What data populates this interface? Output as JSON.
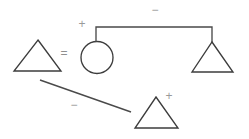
{
  "diagram": {
    "type": "shape-relation-graph",
    "background_color": "#ffffff",
    "stroke_color": "#3c3c3c",
    "label_color": "#9a9a9a",
    "nodes": [
      {
        "id": "triangle-left",
        "shape": "triangle",
        "label": "",
        "apex": [
          38,
          40
        ],
        "base_left": [
          14,
          71
        ],
        "base_right": [
          61,
          71
        ]
      },
      {
        "id": "circle-center",
        "shape": "circle",
        "label": "",
        "center": [
          97,
          57
        ],
        "radius": 16
      },
      {
        "id": "triangle-right",
        "shape": "triangle",
        "label": "",
        "apex": [
          212,
          42
        ],
        "base_left": [
          192,
          72
        ],
        "base_right": [
          233,
          72
        ]
      },
      {
        "id": "triangle-bottom",
        "shape": "triangle",
        "label": "",
        "apex": [
          156,
          97
        ],
        "base_left": [
          135,
          128
        ],
        "base_right": [
          178,
          128
        ]
      }
    ],
    "edges": [
      {
        "id": "edge-equals",
        "from": "triangle-left",
        "to": "circle-center",
        "label": "=",
        "label_pos": [
          64,
          54
        ],
        "style": "relation-symbol"
      },
      {
        "id": "edge-plus-circle",
        "from": "circle-center",
        "to": "bar",
        "label": "+",
        "label_pos": [
          82,
          25
        ],
        "style": "symbol"
      },
      {
        "id": "edge-bar-minus",
        "from": "circle-center",
        "to": "triangle-right",
        "label": "−",
        "label_pos": [
          155,
          11
        ],
        "style": "bracket",
        "path": "M 96 42 L 96 27 L 212 27 L 212 42"
      },
      {
        "id": "edge-diagonal-minus",
        "from": "triangle-left",
        "to": "triangle-bottom",
        "label": "−",
        "label_pos": [
          74,
          106
        ],
        "style": "line",
        "path": "M 40 80 L 131 112"
      },
      {
        "id": "edge-plus-bottom",
        "from": "triangle-bottom",
        "to": "triangle-bottom",
        "label": "+",
        "label_pos": [
          169,
          97
        ],
        "style": "symbol"
      }
    ],
    "symbols": {
      "equals": "=",
      "plus": "+",
      "minus": "−"
    }
  }
}
